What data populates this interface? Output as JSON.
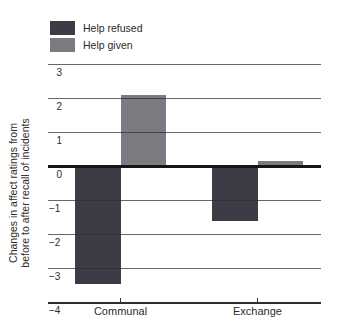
{
  "chart_data": {
    "type": "bar",
    "title": "",
    "categories": [
      "Communal",
      "Exchange"
    ],
    "series": [
      {
        "name": "Help refused",
        "color": "#3e3b46",
        "values": [
          -3.45,
          -1.6
        ]
      },
      {
        "name": "Help given",
        "color": "#7d7b82",
        "values": [
          2.1,
          0.15
        ]
      }
    ],
    "ylabel_line1": "Changes in affect ratings from",
    "ylabel_line2": "before to after recall of incidents",
    "xlabel": "",
    "yticks": [
      3,
      2,
      1,
      0,
      -1,
      -2,
      -3,
      -4
    ],
    "ylim": [
      -4,
      3
    ],
    "grid": true,
    "zero_line": true,
    "legend_position": "top-left"
  },
  "colors": {
    "background": "#ffffff",
    "text": "#2b2b2b",
    "gridline": "#5a5a5e",
    "zero_line": "#161616",
    "axis_line": "#2e2e2e",
    "bar_dark": "#3e3b46",
    "bar_gray": "#7d7b82"
  }
}
